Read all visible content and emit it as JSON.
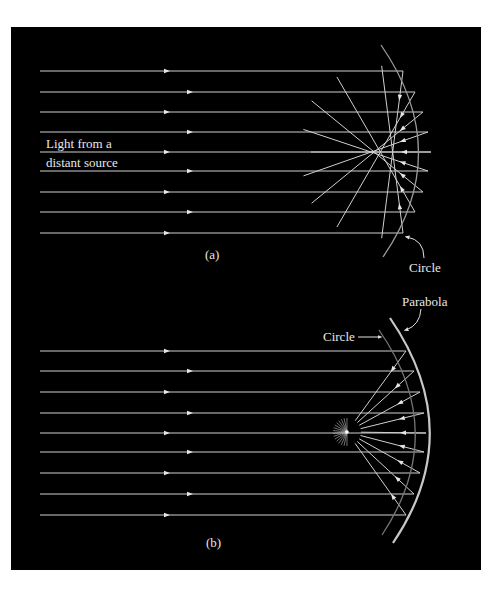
{
  "figure": {
    "background": "#000000",
    "ray_color": "#d8d8d8",
    "panel_a": {
      "caption": "(a)",
      "source_label_line1": "Light from a",
      "source_label_line2": "distant source",
      "mirror_label": "Circle",
      "ray_ys": [
        71,
        92,
        112,
        132,
        152,
        171,
        192,
        212,
        233
      ],
      "ray_end_xs": [
        403,
        415,
        423,
        428,
        431,
        428,
        423,
        415,
        403
      ]
    },
    "panel_b": {
      "caption": "(b)",
      "parabola_label": "Parabola",
      "circle_label": "Circle",
      "ray_ys": [
        351,
        371,
        392,
        413,
        433,
        452,
        473,
        494,
        515
      ],
      "ray_end_xs": [
        406,
        414,
        420,
        424,
        426,
        424,
        420,
        414,
        406
      ],
      "focus": [
        347,
        432
      ]
    }
  }
}
